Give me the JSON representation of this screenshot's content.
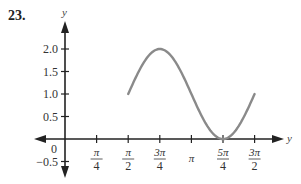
{
  "problem_number": "23.",
  "chart_data": {
    "type": "line",
    "title": "",
    "xlabel": "y",
    "ylabel": "y",
    "function": "y = 1 + sin(2(x - π/2))",
    "x_domain": [
      "π/2",
      "3π/2"
    ],
    "x": [
      1.5708,
      2.3562,
      3.1416,
      3.927,
      4.7124
    ],
    "x_labels_points": [
      "π/2",
      "3π/4",
      "π",
      "5π/4",
      "3π/2"
    ],
    "y": [
      1.0,
      2.0,
      1.0,
      0.0,
      1.0
    ],
    "x_ticks": [
      {
        "value": 0.7854,
        "label_num": "π",
        "label_den": "4"
      },
      {
        "value": 1.5708,
        "label_num": "π",
        "label_den": "2"
      },
      {
        "value": 2.3562,
        "label_num": "3π",
        "label_den": "4"
      },
      {
        "value": 3.1416,
        "label_num": "π",
        "label_den": ""
      },
      {
        "value": 3.927,
        "label_num": "5π",
        "label_den": "4"
      },
      {
        "value": 4.7124,
        "label_num": "3π",
        "label_den": "2"
      }
    ],
    "y_ticks": [
      {
        "value": 2.0,
        "label": "2.0"
      },
      {
        "value": 1.5,
        "label": "1.5"
      },
      {
        "value": 1.0,
        "label": "1.0"
      },
      {
        "value": 0.5,
        "label": "0.5"
      },
      {
        "value": -0.5,
        "label": "−0.5"
      }
    ],
    "origin_label": "0",
    "xlim": [
      -0.9,
      5.3
    ],
    "ylim": [
      -0.8,
      2.6
    ],
    "grid": false,
    "legend": null,
    "curve_color": "#8a8a8a",
    "axis_color": "#222222"
  }
}
